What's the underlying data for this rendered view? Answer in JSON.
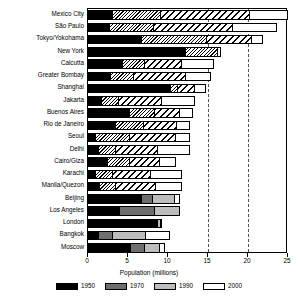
{
  "chart_data": {
    "type": "bar",
    "orientation": "horizontal",
    "title": "",
    "xlabel": "Population (millions)",
    "ylabel": "",
    "xlim": [
      0,
      25
    ],
    "xticks": [
      0,
      5,
      10,
      15,
      20,
      25
    ],
    "gridlines_dashed_at": [
      15,
      20
    ],
    "grid": false,
    "legend_position": "bottom",
    "categories": [
      "Mexico City",
      "São Paulo",
      "Tokyo/Yokohama",
      "New York",
      "Calcutta",
      "Greater Bombay",
      "Shanghai",
      "Jakarta",
      "Buenos Aires",
      "Rio de Janeiro",
      "Seoul",
      "Delhi",
      "Cairo/Giza",
      "Karachi",
      "Manila/Quezon",
      "Beijing",
      "Los Angeles",
      "London",
      "Bangkok",
      "Moscow"
    ],
    "series": [
      {
        "name": "1950",
        "color": "#000000",
        "pattern": "solid-black",
        "values": [
          3.1,
          2.8,
          6.7,
          12.3,
          4.4,
          2.9,
          10.4,
          1.8,
          5.3,
          3.5,
          1.0,
          1.4,
          2.5,
          1.0,
          1.5,
          6.7,
          4.0,
          8.7,
          1.4,
          5.4
        ]
      },
      {
        "name": "1970",
        "color": "#6e6e6e",
        "pattern": "fine-diagonal-hatch",
        "values": [
          9.1,
          8.2,
          14.9,
          16.2,
          7.1,
          5.8,
          11.2,
          3.9,
          8.4,
          7.0,
          5.3,
          3.5,
          5.3,
          3.1,
          3.5,
          8.1,
          8.4,
          8.6,
          3.1,
          7.1
        ]
      },
      {
        "name": "1990",
        "color": "#bdbdbd",
        "pattern": "coarse-diagonal-hatch",
        "values": [
          20.2,
          18.1,
          20.5,
          15.7,
          11.8,
          12.2,
          13.4,
          9.3,
          11.5,
          11.1,
          11.0,
          8.8,
          9.0,
          7.9,
          8.5,
          10.9,
          11.5,
          9.1,
          7.2,
          9.0
        ]
      },
      {
        "name": "2000",
        "color": "#ffffff",
        "pattern": "white-outline",
        "values": [
          25.0,
          23.6,
          21.9,
          16.6,
          15.7,
          15.4,
          14.7,
          13.4,
          13.1,
          12.8,
          12.7,
          12.8,
          11.0,
          11.7,
          11.8,
          11.5,
          10.9,
          9.2,
          10.3,
          9.6
        ]
      }
    ]
  },
  "legend": {
    "items": [
      {
        "label": "1950",
        "swatch": "solid-black"
      },
      {
        "label": "1970",
        "swatch": "fine-diagonal-hatch"
      },
      {
        "label": "1990",
        "swatch": "coarse-diagonal-hatch"
      },
      {
        "label": "2000",
        "swatch": "white-outline"
      }
    ]
  }
}
